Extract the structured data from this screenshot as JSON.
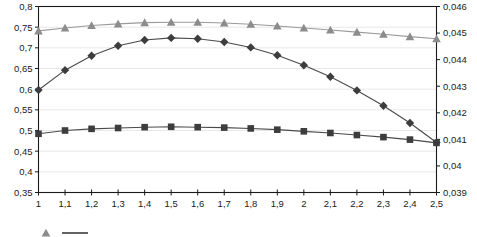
{
  "chart_data": {
    "type": "line",
    "title": "",
    "subtitle": "",
    "xlabel": "",
    "ylabel": "",
    "y2label": "",
    "grid": true,
    "legend_position": "bottom-left",
    "x": [
      "1",
      "1,1",
      "1,2",
      "1,3",
      "1,4",
      "1,5",
      "1,6",
      "1,7",
      "1,8",
      "1,9",
      "2",
      "2,1",
      "2,2",
      "2,3",
      "2,4",
      "2,5"
    ],
    "x_tick_labels": [
      "1",
      "1,1",
      "1,2",
      "1,3",
      "1,4",
      "1,5",
      "1,6",
      "1,7",
      "1,8",
      "1,9",
      "2",
      "2,1",
      "2,2",
      "2,3",
      "2,4",
      "2,5"
    ],
    "left_axis": {
      "min": 0.35,
      "max": 0.8,
      "step": 0.05,
      "tick_labels": [
        "0,35",
        "0,4",
        "0,45",
        "0,5",
        "0,55",
        "0,6",
        "0,65",
        "0,7",
        "0,75",
        "0,8"
      ]
    },
    "right_axis": {
      "min": 0.039,
      "max": 0.046,
      "step": 0.001,
      "tick_labels": [
        "0,039",
        "0,04",
        "0,041",
        "0,042",
        "0,043",
        "0,044",
        "0,045",
        "0,046"
      ]
    },
    "series": [
      {
        "name": "series-triangle",
        "marker": "triangle",
        "color": "#8c8c8c",
        "line_color": "#9a9a9a",
        "axis": "left",
        "values": [
          0.741,
          0.748,
          0.754,
          0.758,
          0.761,
          0.762,
          0.762,
          0.76,
          0.757,
          0.753,
          0.748,
          0.743,
          0.738,
          0.733,
          0.727,
          0.722
        ]
      },
      {
        "name": "series-diamond",
        "marker": "diamond",
        "color": "#3d3d3d",
        "line_color": "#4a4a4a",
        "axis": "left",
        "values": [
          0.598,
          0.646,
          0.681,
          0.705,
          0.719,
          0.724,
          0.722,
          0.714,
          0.701,
          0.682,
          0.658,
          0.63,
          0.597,
          0.56,
          0.518,
          0.471
        ]
      },
      {
        "name": "series-square",
        "marker": "square",
        "color": "#3d3d3d",
        "line_color": "#4a4a4a",
        "axis": "left",
        "values": [
          0.492,
          0.5,
          0.504,
          0.506,
          0.508,
          0.509,
          0.508,
          0.507,
          0.505,
          0.502,
          0.498,
          0.494,
          0.489,
          0.484,
          0.478,
          0.47
        ]
      }
    ],
    "legend_entries": [
      {
        "label": "",
        "marker": "triangle",
        "color": "#8c8c8c"
      },
      {
        "label": "",
        "marker": "line",
        "color": "#3d3d3d"
      }
    ]
  },
  "colors": {
    "background": "#ffffff",
    "axis": "#1a1a1a",
    "gridline": "#e2e2e2",
    "gray_series": "#8c8c8c",
    "dark_series": "#3d3d3d"
  }
}
